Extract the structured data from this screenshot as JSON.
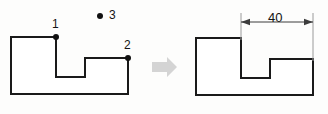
{
  "figure": {
    "background_color": "#fdfdfc",
    "line_color": "#1a1a1a",
    "arrow_color": "#d4d4d4",
    "dimension_color": "#3c3c3c"
  },
  "left_shape": {
    "name": "undimensioned-profile",
    "outline_points": "11,37 56,37 56,77 85,77 85,58 128,58 128,94 11,94",
    "vertex_labels": [
      {
        "id": "1",
        "text": "1",
        "dot_x": 56,
        "dot_y": 37,
        "label_x": 52,
        "label_y": 18
      },
      {
        "id": "2",
        "text": "2",
        "dot_x": 128,
        "dot_y": 58,
        "label_x": 124,
        "label_y": 39
      }
    ],
    "free_points": [
      {
        "id": "3",
        "text": "3",
        "dot_x": 100,
        "dot_y": 16,
        "label_x": 109,
        "label_y": 9
      }
    ]
  },
  "transition_arrow": {
    "name": "transition-arrow",
    "shape": "152,62 167,62 167,57 177,67 167,77 167,72 152,72",
    "direction": "right"
  },
  "right_shape": {
    "name": "dimensioned-profile",
    "outline_points": "196,38 241,38 241,78 270,78 270,59 313,59 313,95 196,95",
    "dimension": {
      "label": "40",
      "value": 40,
      "label_x": 268,
      "label_y": 11,
      "line_y": 22,
      "x_start": 241,
      "x_end": 313,
      "ext_left_x": 241,
      "ext_left_y1": 13,
      "ext_left_y2": 40,
      "ext_right_x": 313,
      "ext_right_y1": 13,
      "ext_right_y2": 61
    }
  }
}
